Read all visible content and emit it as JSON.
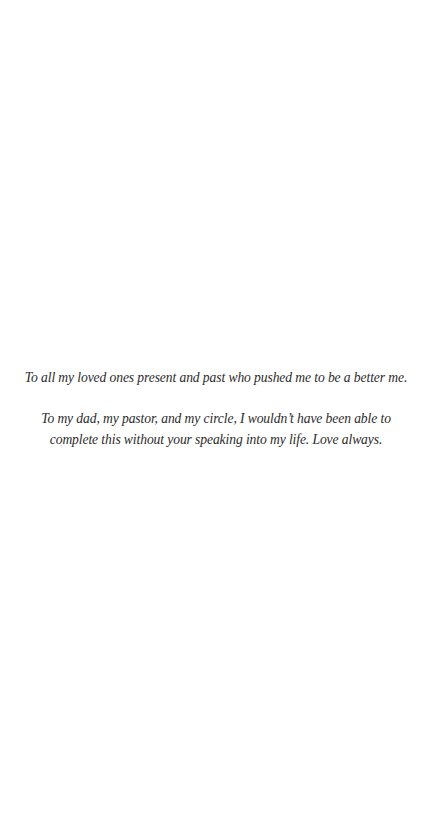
{
  "page": {
    "background": "#ffffff",
    "text_color": "#2b2b2b"
  },
  "dedication": {
    "paragraph_1": "To all my loved ones present and past who pushed me to be a better me.",
    "paragraph_2_line_1": "To my dad, my pastor, and my circle, I wouldn’t have been able to",
    "paragraph_2_line_2": "complete this without your speaking into my life. Love always."
  }
}
